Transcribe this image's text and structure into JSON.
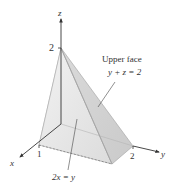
{
  "figure": {
    "axes": {
      "x_label": "x",
      "y_label": "y",
      "z_label": "z",
      "x_tick": "1",
      "y_tick": "2",
      "z_tick": "2"
    },
    "annotations": {
      "upper_face_title": "Upper face",
      "upper_face_equation": "y + z = 2",
      "plane_equation": "2x = y"
    },
    "colors": {
      "axis": "#333333",
      "face_light": "#ececec",
      "face_mid": "#dedede",
      "face_dark": "#cfcfcf",
      "edge": "#9a9a9a"
    }
  }
}
